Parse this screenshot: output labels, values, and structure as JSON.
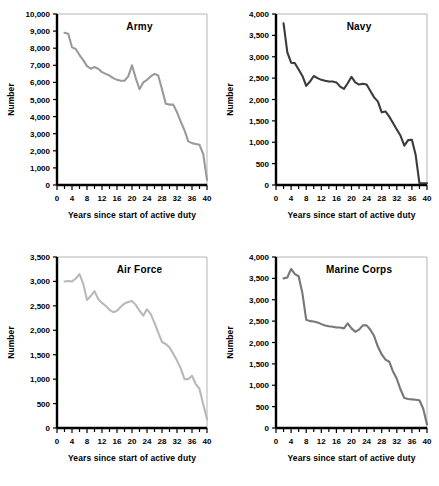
{
  "figure": {
    "name": "military-separations-by-branch",
    "panel_order": [
      "army",
      "navy",
      "airforce",
      "marines"
    ]
  },
  "chart_data": [
    {
      "type": "line",
      "title": "Army",
      "xlabel": "Years since start of active duty",
      "ylabel": "Number",
      "xlim": [
        0,
        40
      ],
      "ylim": [
        0,
        10000
      ],
      "xticks": [
        0,
        4,
        8,
        12,
        16,
        20,
        24,
        28,
        32,
        36,
        40
      ],
      "xtick_labels": [
        "0",
        "4",
        "8",
        "12",
        "16",
        "20",
        "24",
        "28",
        "32",
        "36",
        "40"
      ],
      "minor_xtick_step": 2,
      "yticks": [
        0,
        1000,
        2000,
        3000,
        4000,
        5000,
        6000,
        7000,
        8000,
        9000,
        10000
      ],
      "ytick_labels": [
        "0",
        "1,000",
        "2,000",
        "3,000",
        "4,000",
        "5,000",
        "6,000",
        "7,000",
        "8,000",
        "9,000",
        "10,000"
      ],
      "grid": false,
      "legend": "none",
      "line_color": "#9a9a9a",
      "x": [
        2,
        3,
        4,
        5,
        6,
        7,
        8,
        9,
        10,
        11,
        12,
        13,
        14,
        15,
        16,
        17,
        18,
        19,
        20,
        21,
        22,
        23,
        24,
        25,
        26,
        27,
        28,
        29,
        30,
        31,
        32,
        33,
        34,
        35,
        36,
        37,
        38,
        39,
        40
      ],
      "values": [
        8900,
        8850,
        8050,
        7950,
        7600,
        7300,
        6950,
        6800,
        6900,
        6800,
        6600,
        6500,
        6400,
        6250,
        6150,
        6100,
        6100,
        6350,
        7000,
        6250,
        5600,
        6000,
        6150,
        6350,
        6500,
        6400,
        5600,
        4750,
        4700,
        4700,
        4250,
        3700,
        3200,
        2550,
        2450,
        2400,
        2350,
        1800,
        300
      ]
    },
    {
      "type": "line",
      "title": "Navy",
      "xlabel": "Years since start of active duty",
      "ylabel": "Number",
      "xlim": [
        0,
        40
      ],
      "ylim": [
        0,
        4000
      ],
      "xticks": [
        0,
        4,
        8,
        12,
        16,
        20,
        24,
        28,
        32,
        36,
        40
      ],
      "xtick_labels": [
        "0",
        "4",
        "8",
        "12",
        "16",
        "20",
        "24",
        "28",
        "32",
        "36",
        "40"
      ],
      "minor_xtick_step": 2,
      "yticks": [
        0,
        500,
        1000,
        1500,
        2000,
        2500,
        3000,
        3500,
        4000
      ],
      "ytick_labels": [
        "0",
        "500",
        "1,000",
        "1,500",
        "2,000",
        "2,500",
        "3,000",
        "3,500",
        "4,000"
      ],
      "grid": false,
      "legend": "none",
      "line_color": "#3b3b3b",
      "x": [
        2,
        3,
        4,
        5,
        6,
        7,
        8,
        9,
        10,
        11,
        12,
        13,
        14,
        15,
        16,
        17,
        18,
        19,
        20,
        21,
        22,
        23,
        24,
        25,
        26,
        27,
        28,
        29,
        30,
        31,
        32,
        33,
        34,
        35,
        36,
        37,
        38,
        39,
        40
      ],
      "values": [
        3780,
        3100,
        2860,
        2850,
        2700,
        2550,
        2320,
        2420,
        2550,
        2500,
        2460,
        2440,
        2420,
        2420,
        2400,
        2300,
        2250,
        2380,
        2530,
        2400,
        2350,
        2370,
        2350,
        2200,
        2050,
        1950,
        1700,
        1720,
        1600,
        1450,
        1300,
        1150,
        920,
        1050,
        1060,
        700,
        40,
        40,
        40
      ]
    },
    {
      "type": "line",
      "title": "Air Force",
      "xlabel": "Years since start of active duty",
      "ylabel": "Number",
      "xlim": [
        0,
        40
      ],
      "ylim": [
        0,
        3500
      ],
      "xticks": [
        0,
        4,
        8,
        12,
        16,
        20,
        24,
        28,
        32,
        36,
        40
      ],
      "xtick_labels": [
        "0",
        "4",
        "8",
        "12",
        "16",
        "20",
        "24",
        "28",
        "32",
        "36",
        "40"
      ],
      "minor_xtick_step": 2,
      "yticks": [
        0,
        500,
        1000,
        1500,
        2000,
        2500,
        3000,
        3500
      ],
      "ytick_labels": [
        "0",
        "500",
        "1,000",
        "1,500",
        "2,000",
        "2,500",
        "3,000",
        "3,500"
      ],
      "grid": false,
      "legend": "none",
      "line_color": "#b9b9b9",
      "x": [
        2,
        3,
        4,
        5,
        6,
        7,
        8,
        9,
        10,
        11,
        12,
        13,
        14,
        15,
        16,
        17,
        18,
        19,
        20,
        21,
        22,
        23,
        24,
        25,
        26,
        27,
        28,
        29,
        30,
        31,
        32,
        33,
        34,
        35,
        36,
        37,
        38,
        39,
        40
      ],
      "values": [
        3000,
        3010,
        3000,
        3060,
        3150,
        2950,
        2620,
        2700,
        2800,
        2640,
        2560,
        2500,
        2420,
        2370,
        2400,
        2480,
        2550,
        2580,
        2600,
        2520,
        2400,
        2300,
        2430,
        2330,
        2150,
        1950,
        1760,
        1720,
        1650,
        1520,
        1380,
        1220,
        1000,
        1000,
        1070,
        900,
        800,
        480,
        180
      ]
    },
    {
      "type": "line",
      "title": "Marine Corps",
      "xlabel": "Years since start of active duty",
      "ylabel": "Number",
      "xlim": [
        0,
        40
      ],
      "ylim": [
        0,
        4000
      ],
      "xticks": [
        0,
        4,
        8,
        12,
        16,
        20,
        24,
        28,
        32,
        36,
        40
      ],
      "xtick_labels": [
        "0",
        "4",
        "8",
        "12",
        "16",
        "20",
        "24",
        "28",
        "32",
        "36",
        "40"
      ],
      "minor_xtick_step": 2,
      "yticks": [
        0,
        500,
        1000,
        1500,
        2000,
        2500,
        3000,
        3500,
        4000
      ],
      "ytick_labels": [
        "0",
        "500",
        "1,000",
        "1,500",
        "2,000",
        "2,500",
        "3,000",
        "3,500",
        "4,000"
      ],
      "grid": false,
      "legend": "none",
      "line_color": "#777777",
      "x": [
        2,
        3,
        4,
        5,
        6,
        7,
        8,
        9,
        10,
        11,
        12,
        13,
        14,
        15,
        16,
        17,
        18,
        19,
        20,
        21,
        22,
        23,
        24,
        25,
        26,
        27,
        28,
        29,
        30,
        31,
        32,
        33,
        34,
        35,
        36,
        37,
        38,
        39,
        40
      ],
      "values": [
        3500,
        3520,
        3720,
        3600,
        3550,
        3150,
        2530,
        2500,
        2490,
        2470,
        2430,
        2400,
        2380,
        2370,
        2350,
        2350,
        2330,
        2450,
        2330,
        2250,
        2300,
        2400,
        2400,
        2300,
        2150,
        1900,
        1720,
        1600,
        1550,
        1320,
        1150,
        900,
        700,
        680,
        670,
        660,
        650,
        450,
        80
      ]
    }
  ]
}
